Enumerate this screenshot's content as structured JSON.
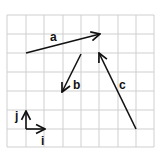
{
  "diagram": {
    "title": "",
    "grid": {
      "x_lines": [
        7,
        26,
        44,
        63,
        81,
        99,
        118,
        136,
        154
      ],
      "y_lines": [
        15,
        34,
        53,
        72,
        91,
        110,
        129,
        147
      ],
      "color": "#cfcfcf"
    },
    "vectors": [
      {
        "name": "a",
        "label": "a",
        "from": [
          26,
          53
        ],
        "to": [
          100,
          34
        ],
        "label_pos": [
          50,
          41
        ]
      },
      {
        "name": "b",
        "label": "b",
        "from": [
          81,
          54
        ],
        "to": [
          62,
          92
        ],
        "label_pos": [
          73,
          89
        ]
      },
      {
        "name": "c",
        "label": "c",
        "from": [
          136,
          129
        ],
        "to": [
          99,
          53
        ],
        "label_pos": [
          119,
          89
        ]
      }
    ],
    "basis": {
      "origin": [
        26,
        129
      ],
      "i": {
        "label": "i",
        "to": [
          45,
          129
        ],
        "label_pos": [
          41,
          145
        ]
      },
      "j": {
        "label": "j",
        "to": [
          26,
          111
        ],
        "label_pos": [
          15,
          120
        ]
      }
    },
    "stroke_color": "#111111"
  }
}
